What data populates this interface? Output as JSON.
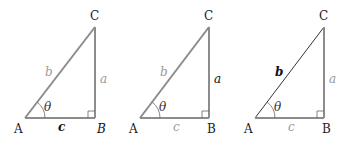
{
  "figure": {
    "triangles": [
      {
        "id": "left",
        "vertices": {
          "A": "A",
          "B": "B",
          "C": "C"
        },
        "sides": {
          "a": "a",
          "b": "b",
          "c": "c"
        },
        "angle": "θ",
        "emphasis": "side c and vertex B"
      },
      {
        "id": "middle",
        "vertices": {
          "A": "A",
          "B": "B",
          "C": "C"
        },
        "sides": {
          "a": "a",
          "b": "b",
          "c": "c"
        },
        "angle": "θ",
        "emphasis": "side a"
      },
      {
        "id": "right",
        "vertices": {
          "A": "A",
          "B": "B",
          "C": "C"
        },
        "sides": {
          "a": "a",
          "b": "b",
          "c": "c"
        },
        "angle": "θ",
        "emphasis": "side b"
      }
    ],
    "colors": {
      "edge_gray": "#8c8c8c",
      "edge_dark": "#333333",
      "label_muted": "#9a9a9a",
      "label_strong": "#111111"
    }
  }
}
